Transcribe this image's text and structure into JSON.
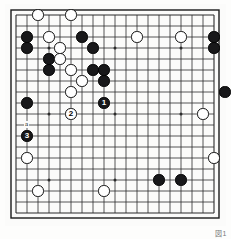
{
  "figure": {
    "kind": "go-board-diagram",
    "caption": "図1",
    "board": {
      "size": 19,
      "origin_x": 11,
      "origin_y": 11,
      "spacing": 11.0,
      "line_color": "#2b2b2b",
      "border_color": "#1a1a1a",
      "background": "#fbfbfa",
      "star_points": [
        {
          "col": 3,
          "row": 3
        },
        {
          "col": 9,
          "row": 3
        },
        {
          "col": 15,
          "row": 3
        },
        {
          "col": 3,
          "row": 9
        },
        {
          "col": 9,
          "row": 9
        },
        {
          "col": 15,
          "row": 9
        },
        {
          "col": 3,
          "row": 15
        },
        {
          "col": 9,
          "row": 15
        },
        {
          "col": 15,
          "row": 15
        }
      ]
    },
    "stone_colors": {
      "black": "#18181a",
      "white": "#ffffff",
      "outline": "#111111"
    },
    "stones": [
      {
        "col": 3,
        "row": 1,
        "color": "white",
        "label": ""
      },
      {
        "col": 6,
        "row": 1,
        "color": "white",
        "label": ""
      },
      {
        "col": 2,
        "row": 3,
        "color": "black",
        "label": ""
      },
      {
        "col": 4,
        "row": 3,
        "color": "white",
        "label": ""
      },
      {
        "col": 7,
        "row": 3,
        "color": "black",
        "label": ""
      },
      {
        "col": 12,
        "row": 3,
        "color": "white",
        "label": ""
      },
      {
        "col": 16,
        "row": 3,
        "color": "white",
        "label": ""
      },
      {
        "col": 19,
        "row": 3,
        "color": "black",
        "label": ""
      },
      {
        "col": 2,
        "row": 4,
        "color": "black",
        "label": ""
      },
      {
        "col": 5,
        "row": 4,
        "color": "white",
        "label": ""
      },
      {
        "col": 8,
        "row": 4,
        "color": "black",
        "label": ""
      },
      {
        "col": 19,
        "row": 4,
        "color": "black",
        "label": ""
      },
      {
        "col": 4,
        "row": 5,
        "color": "black",
        "label": ""
      },
      {
        "col": 5,
        "row": 5,
        "color": "white",
        "label": ""
      },
      {
        "col": 4,
        "row": 6,
        "color": "black",
        "label": ""
      },
      {
        "col": 6,
        "row": 6,
        "color": "white",
        "label": ""
      },
      {
        "col": 8,
        "row": 6,
        "color": "black",
        "label": ""
      },
      {
        "col": 9,
        "row": 6,
        "color": "black",
        "label": ""
      },
      {
        "col": 7,
        "row": 7,
        "color": "white",
        "label": ""
      },
      {
        "col": 9,
        "row": 7,
        "color": "black",
        "label": ""
      },
      {
        "col": 6,
        "row": 8,
        "color": "white",
        "label": ""
      },
      {
        "col": 20,
        "row": 8,
        "color": "black",
        "label": ""
      },
      {
        "col": 2,
        "row": 9,
        "color": "black",
        "label": ""
      },
      {
        "col": 9,
        "row": 9,
        "color": "black",
        "label": "1"
      },
      {
        "col": 6,
        "row": 10,
        "color": "white",
        "label": "2"
      },
      {
        "col": 18,
        "row": 10,
        "color": "white",
        "label": ""
      },
      {
        "col": 2,
        "row": 12,
        "color": "black",
        "label": "3"
      },
      {
        "col": 2,
        "row": 14,
        "color": "white",
        "label": ""
      },
      {
        "col": 19,
        "row": 14,
        "color": "white",
        "label": ""
      },
      {
        "col": 14,
        "row": 16,
        "color": "black",
        "label": ""
      },
      {
        "col": 16,
        "row": 16,
        "color": "black",
        "label": ""
      },
      {
        "col": 3,
        "row": 17,
        "color": "white",
        "label": ""
      },
      {
        "col": 9,
        "row": 17,
        "color": "white",
        "label": ""
      }
    ],
    "markers": [
      {
        "col": 2,
        "row": 11,
        "text": "a"
      }
    ]
  }
}
